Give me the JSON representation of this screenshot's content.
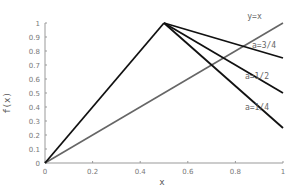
{
  "chart_data": {
    "type": "line",
    "title": "",
    "xlabel": "x",
    "ylabel": "f(x)",
    "xlim": [
      0,
      1
    ],
    "ylim": [
      0,
      1
    ],
    "grid": false,
    "legend": "inline annotations at right",
    "x_ticks": [
      "0",
      "0.2",
      "0.4",
      "0.6",
      "0.8",
      "1"
    ],
    "y_ticks": [
      "0",
      "0.1",
      "0.2",
      "0.3",
      "0.4",
      "0.5",
      "0.6",
      "0.7",
      "0.8",
      "0.9",
      "1"
    ],
    "series": [
      {
        "name": "y=x",
        "color": "#666666",
        "x": [
          0,
          1
        ],
        "y": [
          0,
          1
        ]
      },
      {
        "name": "rise",
        "color": "#111111",
        "x": [
          0,
          0.5
        ],
        "y": [
          0,
          1
        ]
      },
      {
        "name": "a=3/4",
        "color": "#111111",
        "x": [
          0.5,
          1
        ],
        "y": [
          1,
          0.75
        ]
      },
      {
        "name": "a=1/2",
        "color": "#111111",
        "x": [
          0.5,
          1
        ],
        "y": [
          1,
          0.5
        ]
      },
      {
        "name": "a=1/4",
        "color": "#111111",
        "x": [
          0.5,
          1
        ],
        "y": [
          1,
          0.25
        ]
      }
    ],
    "annotations": [
      {
        "text": "y=x",
        "x": 0.85,
        "y": 1.03
      },
      {
        "text": "a=3/4",
        "x": 0.87,
        "y": 0.82
      },
      {
        "text": "a=1/2",
        "x": 0.84,
        "y": 0.6
      },
      {
        "text": "a=1/4",
        "x": 0.84,
        "y": 0.38
      }
    ]
  }
}
